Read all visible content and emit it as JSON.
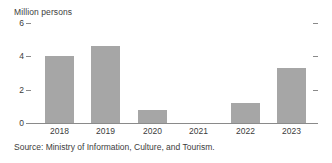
{
  "chart_data": {
    "type": "bar",
    "title": "Million persons",
    "xlabel": "",
    "ylabel": "",
    "categories": [
      "2018",
      "2019",
      "2020",
      "2021",
      "2022",
      "2023"
    ],
    "values": [
      4.05,
      4.6,
      0.8,
      0,
      1.2,
      3.3
    ],
    "series": [
      {
        "name": "Visitor arrivals",
        "values": [
          4.05,
          4.6,
          0.8,
          0,
          1.2,
          3.3
        ]
      }
    ],
    "ylim": [
      0,
      6
    ],
    "yticks": [
      0,
      2,
      4,
      6
    ],
    "ytick_labels": [
      "0",
      "2",
      "4",
      "6"
    ],
    "grid": false,
    "legend": false,
    "legend_position": "none",
    "bar_color": "#a6a6a6",
    "axis_color": "#8a8a8a",
    "text_color": "#3c3c3c",
    "background": "#ffffff",
    "source": "Source: Ministry of Information, Culture, and Tourism."
  }
}
